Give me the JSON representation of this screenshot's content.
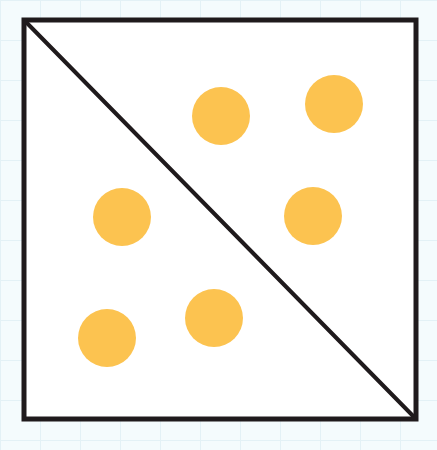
{
  "diagram": {
    "frame": {
      "x": 24,
      "y": 20,
      "width": 392,
      "height": 399,
      "stroke": "#1f1a1c",
      "stroke_width": 5
    },
    "diagonal": {
      "x1": 24,
      "y1": 20,
      "x2": 416,
      "y2": 419,
      "stroke": "#1f1a1c",
      "stroke_width": 4
    },
    "dot_color": "#fcc350",
    "dot_radius": 29,
    "dots": [
      {
        "region": "upper-right",
        "cx": 221,
        "cy": 116
      },
      {
        "region": "upper-right",
        "cx": 334,
        "cy": 104
      },
      {
        "region": "upper-right",
        "cx": 313,
        "cy": 216
      },
      {
        "region": "lower-left",
        "cx": 122,
        "cy": 217
      },
      {
        "region": "lower-left",
        "cx": 107,
        "cy": 338
      },
      {
        "region": "lower-left",
        "cx": 214,
        "cy": 318
      }
    ],
    "counts": {
      "upper_right": 3,
      "lower_left": 3,
      "total": 6
    }
  }
}
